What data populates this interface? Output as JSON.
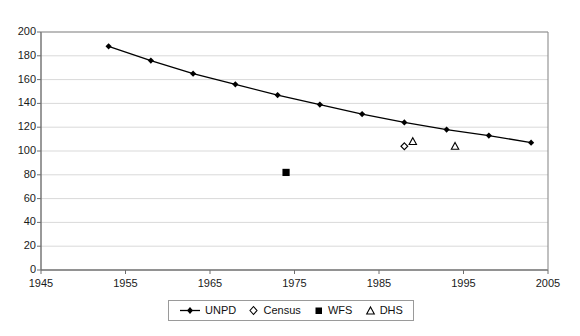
{
  "chart_data": {
    "type": "line",
    "title": "",
    "xlabel": "",
    "ylabel": "",
    "xlim": [
      1945,
      2005
    ],
    "ylim": [
      0,
      200
    ],
    "xticks": [
      1945,
      1955,
      1965,
      1975,
      1985,
      1995,
      2005
    ],
    "yticks": [
      0,
      20,
      40,
      60,
      80,
      100,
      120,
      140,
      160,
      180,
      200
    ],
    "grid": "horizontal",
    "legend_position": "bottom-center",
    "series": [
      {
        "name": "UNPD",
        "style": "line-with-markers",
        "marker": "filled-diamond",
        "color": "#000000",
        "points": [
          {
            "x": 1953,
            "y": 188
          },
          {
            "x": 1958,
            "y": 176
          },
          {
            "x": 1963,
            "y": 165
          },
          {
            "x": 1968,
            "y": 156
          },
          {
            "x": 1973,
            "y": 147
          },
          {
            "x": 1978,
            "y": 139
          },
          {
            "x": 1983,
            "y": 131
          },
          {
            "x": 1988,
            "y": 124
          },
          {
            "x": 1993,
            "y": 118
          },
          {
            "x": 1998,
            "y": 113
          },
          {
            "x": 2003,
            "y": 107
          }
        ]
      },
      {
        "name": "Census",
        "style": "markers",
        "marker": "open-diamond",
        "color": "#000000",
        "points": [
          {
            "x": 1988,
            "y": 104
          }
        ]
      },
      {
        "name": "WFS",
        "style": "markers",
        "marker": "filled-square",
        "color": "#000000",
        "points": [
          {
            "x": 1974,
            "y": 82
          }
        ]
      },
      {
        "name": "DHS",
        "style": "markers",
        "marker": "open-triangle",
        "color": "#000000",
        "points": [
          {
            "x": 1989,
            "y": 108
          },
          {
            "x": 1994,
            "y": 104
          }
        ]
      }
    ]
  },
  "axes": {
    "y_tick_labels": [
      "200",
      "180",
      "160",
      "140",
      "120",
      "100",
      "80",
      "60",
      "40",
      "20",
      "0"
    ],
    "x_tick_labels": [
      "1945",
      "1955",
      "1965",
      "1975",
      "1985",
      "1995",
      "2005"
    ]
  },
  "legend": {
    "entries": [
      {
        "label": "UNPD",
        "marker": "line-filled-diamond"
      },
      {
        "label": "Census",
        "marker": "open-diamond"
      },
      {
        "label": "WFS",
        "marker": "filled-square"
      },
      {
        "label": "DHS",
        "marker": "open-triangle"
      }
    ]
  },
  "colors": {
    "series": "#000000",
    "gridline": "#d9d9d9",
    "axis": "#808080",
    "background": "#ffffff"
  }
}
